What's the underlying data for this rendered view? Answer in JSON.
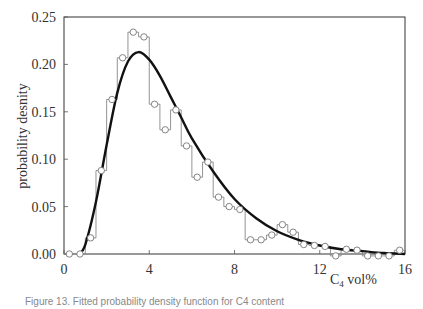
{
  "chart_data": {
    "type": "line",
    "title": "",
    "xlabel": "C4 vol%",
    "xlabel_main": "C",
    "xlabel_sub": "4",
    "xlabel_rest": " vol%",
    "ylabel": "probability desnity",
    "xlim": [
      0,
      16
    ],
    "ylim": [
      0,
      0.25
    ],
    "xticks": [
      0,
      4,
      8,
      12,
      16
    ],
    "xtick_labels": [
      "0",
      "4",
      "8",
      "12",
      "16"
    ],
    "yticks": [
      0,
      0.05,
      0.1,
      0.15,
      0.2,
      0.25
    ],
    "ytick_labels": [
      "0.00",
      "0.05",
      "0.10",
      "0.15",
      "0.20",
      "0.25"
    ],
    "grid": false,
    "legend": null,
    "series": [
      {
        "name": "empirical histogram (step, circles)",
        "style": "step-with-markers",
        "bin_width": 0.5,
        "x": [
          0.25,
          0.75,
          1.25,
          1.75,
          2.25,
          2.75,
          3.25,
          3.75,
          4.25,
          4.75,
          5.25,
          5.75,
          6.25,
          6.75,
          7.25,
          7.75,
          8.25,
          8.75,
          9.25,
          9.75,
          10.25,
          10.75,
          11.25,
          11.75,
          12.25,
          12.75,
          13.25,
          13.75,
          14.25,
          14.75,
          15.25,
          15.75
        ],
        "values": [
          0.0,
          0.0,
          0.017,
          0.088,
          0.163,
          0.207,
          0.234,
          0.229,
          0.158,
          0.131,
          0.152,
          0.114,
          0.081,
          0.097,
          0.06,
          0.05,
          0.047,
          0.015,
          0.015,
          0.02,
          0.031,
          0.023,
          0.01,
          0.009,
          0.008,
          -0.002,
          0.005,
          0.004,
          -0.002,
          -0.002,
          -0.002,
          0.004
        ]
      },
      {
        "name": "fitted probability density",
        "style": "thick-line",
        "x": [
          0.7,
          1.0,
          1.5,
          2.0,
          2.5,
          3.0,
          3.5,
          4.0,
          4.5,
          5.0,
          5.5,
          6.0,
          7.0,
          8.0,
          9.0,
          10.0,
          11.0,
          12.0,
          13.0,
          14.0,
          15.0,
          16.0
        ],
        "values": [
          0.0,
          0.01,
          0.055,
          0.115,
          0.17,
          0.203,
          0.213,
          0.205,
          0.188,
          0.166,
          0.144,
          0.122,
          0.087,
          0.058,
          0.038,
          0.024,
          0.015,
          0.009,
          0.005,
          0.003,
          0.001,
          0.0
        ]
      }
    ]
  },
  "caption": "Figure 13. Fitted probability density function for C4 content"
}
